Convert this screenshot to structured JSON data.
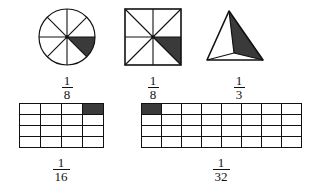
{
  "colors": {
    "stroke": "#111111",
    "shade": "#3a3a3a",
    "background": "#ffffff"
  },
  "figures": [
    {
      "id": "circle-eighths",
      "shape_name": "circle",
      "total_parts": 8,
      "shaded_parts": 1,
      "shaded_position": "sector between 0 and 45 degrees clockwise from right (lower-right)",
      "fraction": {
        "numerator": "1",
        "denominator": "8",
        "text": "1/8"
      }
    },
    {
      "id": "square-eighths",
      "shape_name": "square",
      "total_parts": 8,
      "shaded_parts": 1,
      "shaded_position": "triangle at center, right-middle, bottom-right corner",
      "fraction": {
        "numerator": "1",
        "denominator": "8",
        "text": "1/8"
      }
    },
    {
      "id": "triangle-thirds",
      "shape_name": "triangle",
      "total_parts": 3,
      "shaded_parts": 1,
      "shaded_position": "right region from interior point to apex and bottom-right vertex",
      "fraction": {
        "numerator": "1",
        "denominator": "3",
        "text": "1/3"
      }
    },
    {
      "id": "grid-sixteenths",
      "shape_name": "rectangle-grid",
      "columns": 4,
      "rows": 4,
      "total_parts": 16,
      "shaded_parts": 1,
      "shaded_cells": [
        {
          "row": 0,
          "col": 3
        }
      ],
      "fraction": {
        "numerator": "1",
        "denominator": "16",
        "text": "1/16"
      }
    },
    {
      "id": "grid-thirtyseconds",
      "shape_name": "rectangle-grid",
      "columns": 8,
      "rows": 4,
      "total_parts": 32,
      "shaded_parts": 1,
      "shaded_cells": [
        {
          "row": 0,
          "col": 0
        }
      ],
      "fraction": {
        "numerator": "1",
        "denominator": "32",
        "text": "1/32"
      }
    }
  ]
}
